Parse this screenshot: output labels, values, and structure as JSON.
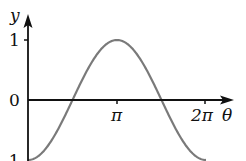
{
  "chart_data": {
    "type": "line",
    "title": "",
    "xlabel": "θ",
    "ylabel": "y",
    "function": "y = -cos(θ)",
    "x_ticks": [
      {
        "value": 3.14159,
        "label": "π"
      },
      {
        "value": 6.28318,
        "label": "2π"
      }
    ],
    "y_ticks": [
      {
        "value": 1,
        "label": "1"
      },
      {
        "value": 0,
        "label": "0"
      },
      {
        "value": -1,
        "label": "-1"
      }
    ],
    "xlim": [
      0,
      6.8
    ],
    "ylim": [
      -1,
      1.4
    ],
    "grid": false,
    "legend": null,
    "series": [
      {
        "name": "-cos θ",
        "color": "#7a7a7a",
        "x": [
          0,
          0.785,
          1.571,
          2.356,
          3.142,
          3.927,
          4.712,
          5.498,
          6.283
        ],
        "y": [
          -1,
          -0.707,
          0,
          0.707,
          1,
          0.707,
          0,
          -0.707,
          -1
        ]
      }
    ]
  },
  "labels": {
    "y_axis": "y",
    "x_axis": "θ",
    "tick_1": "1",
    "tick_0": "0",
    "tick_neg1": "-1",
    "tick_pi": "π",
    "tick_2pi": "2π"
  },
  "colors": {
    "axis": "#111111",
    "curve": "#7a7a7a"
  }
}
